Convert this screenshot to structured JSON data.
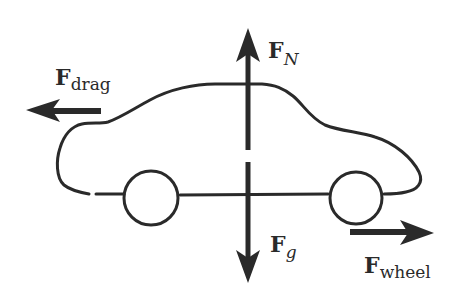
{
  "diagram": {
    "colors": {
      "ink": "#2a2a2a",
      "background": "#ffffff"
    },
    "forces": [
      {
        "id": "drag",
        "symbol": "F",
        "subscript": "drag",
        "direction": "left"
      },
      {
        "id": "normal",
        "symbol": "F",
        "subscript": "N",
        "direction": "up"
      },
      {
        "id": "gravity",
        "symbol": "F",
        "subscript": "g",
        "direction": "down"
      },
      {
        "id": "wheel",
        "symbol": "F",
        "subscript": "wheel",
        "direction": "right"
      }
    ],
    "objects": [
      {
        "id": "car-body",
        "shape": "car outline"
      },
      {
        "id": "rear-wheel",
        "shape": "circle"
      },
      {
        "id": "front-wheel",
        "shape": "circle"
      }
    ]
  }
}
